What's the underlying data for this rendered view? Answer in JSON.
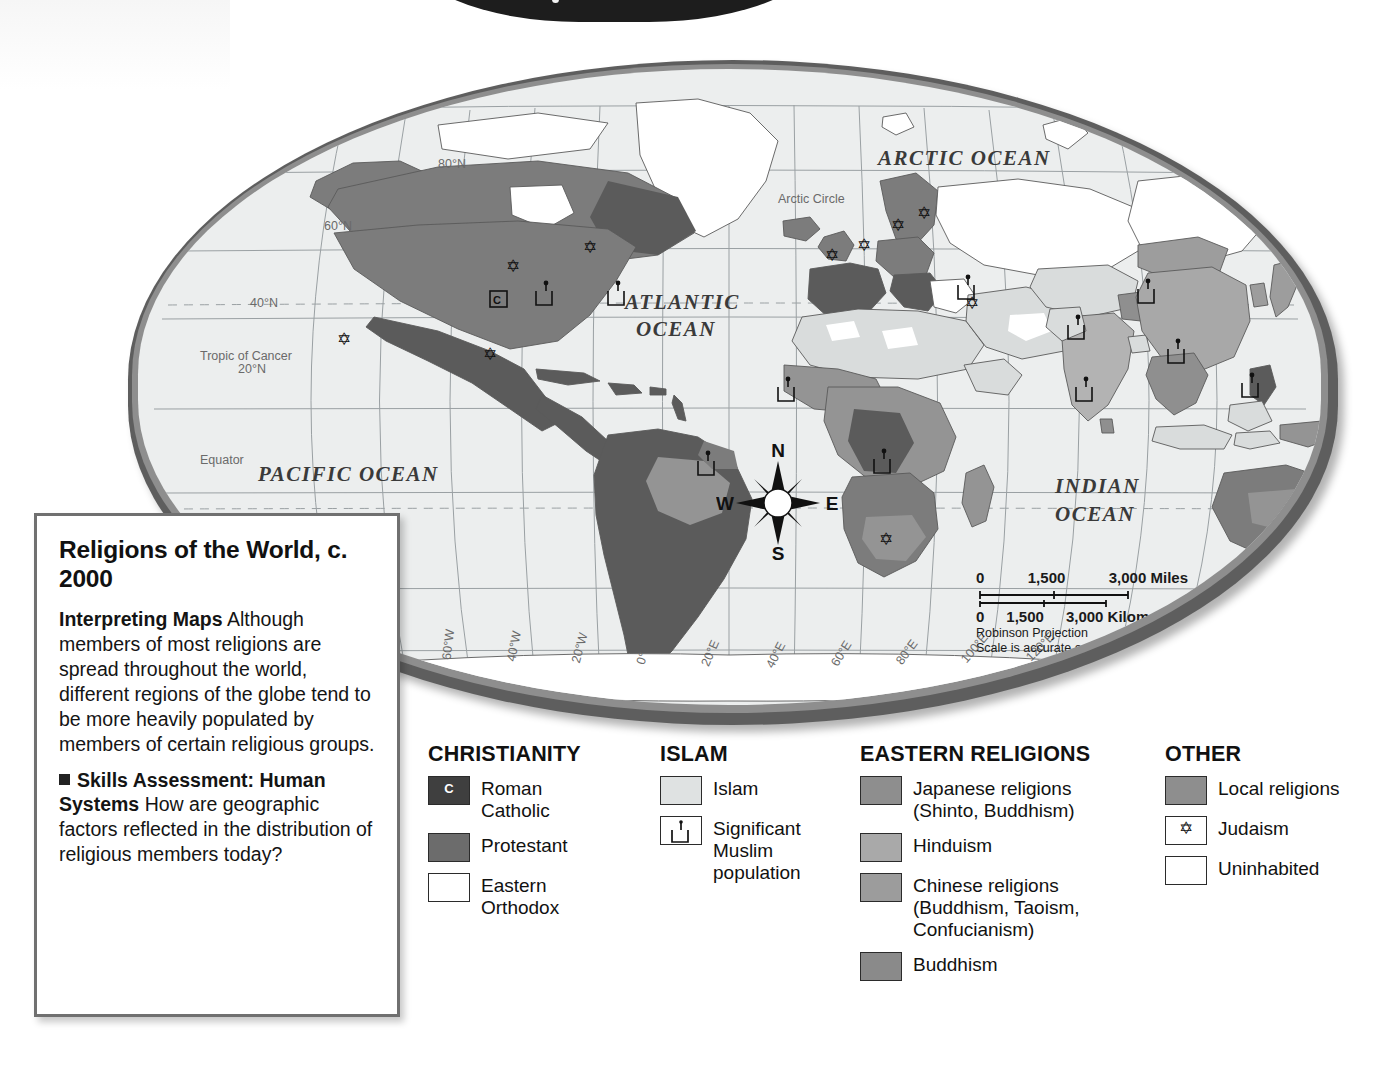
{
  "map": {
    "ocean_labels": [
      {
        "text": "ARCTIC OCEAN",
        "x": 740,
        "y": 96
      },
      {
        "text": "ATLANTIC",
        "x": 487,
        "y": 240
      },
      {
        "text": "OCEAN",
        "x": 498,
        "y": 267
      },
      {
        "text": "PACIFIC  OCEAN",
        "x": 120,
        "y": 412
      },
      {
        "text": "INDIAN",
        "x": 917,
        "y": 424
      },
      {
        "text": "OCEAN",
        "x": 917,
        "y": 452
      },
      {
        "text": "PACIFIC",
        "x": 1218,
        "y": 322
      },
      {
        "text": "OCEAN",
        "x": 1218,
        "y": 350
      }
    ],
    "arctic_circle_label": "Arctic Circle",
    "latitude_labels": [
      {
        "text": "80°N",
        "x": 300,
        "y": 99
      },
      {
        "text": "60°N",
        "x": 186,
        "y": 161
      },
      {
        "text": "40°N",
        "x": 112,
        "y": 238
      },
      {
        "text": "20°N",
        "x": 100,
        "y": 304
      },
      {
        "text": "Equator",
        "x": 62,
        "y": 395
      },
      {
        "text": "20°S",
        "x": 62,
        "y": 478
      }
    ],
    "tropic_labels": [
      {
        "text": "Tropic of Cancer",
        "x": 62,
        "y": 291
      },
      {
        "text": "Tropic of Capricorn",
        "x": 62,
        "y": 493
      }
    ],
    "longitude_labels": [
      "80°W",
      "60°W",
      "40°W",
      "20°W",
      "0°",
      "20°E",
      "40°E",
      "60°E",
      "80°E",
      "100°E",
      "120°E",
      "140°E",
      "160°E"
    ],
    "compass": {
      "north": "N",
      "south": "S",
      "east": "E",
      "west": "W"
    },
    "scale": {
      "miles_ticks": [
        "0",
        "1,500",
        "3,000 Miles"
      ],
      "km_ticks": [
        "0",
        "1,500",
        "3,000 Kilometers"
      ],
      "projection": "Robinson Projection",
      "note": "Scale is accurate only along the equator."
    }
  },
  "caption": {
    "title": "Religions of the World, c. 2000",
    "interpreting_lead": "Interpreting Maps",
    "interpreting_body": "Although members of most religions are spread throughout the world, different regions of the globe tend to be more heavily populated by members of certain religious groups.",
    "skills_lead": "Skills Assessment:",
    "skills_lead2": "Human Systems",
    "skills_body": "How are geographic factors reflected in the distribution of religious members today?"
  },
  "legend": {
    "columns": [
      {
        "title": "CHRISTIANITY",
        "items": [
          {
            "label": "Roman Catholic",
            "swatch": "cath",
            "glyph": "C",
            "color": "#3f3f3f"
          },
          {
            "label": "Protestant",
            "swatch": "prot",
            "glyph": "",
            "color": "#6c6c6c"
          },
          {
            "label": "Eastern Orthodox",
            "swatch": "orth",
            "glyph": "",
            "color": "#ffffff"
          }
        ]
      },
      {
        "title": "ISLAM",
        "items": [
          {
            "label": "Islam",
            "swatch": "islam",
            "glyph": "",
            "color": "#dfe2e2"
          },
          {
            "label": "Significant Muslim population",
            "swatch": "sigmus",
            "glyph": "mosque-icon",
            "color": "#ffffff"
          }
        ]
      },
      {
        "title": "EASTERN RELIGIONS",
        "items": [
          {
            "label": "Japanese religions (Shinto, Buddhism)",
            "swatch": "jap",
            "glyph": "",
            "color": "#8e8e8e"
          },
          {
            "label": "Hinduism",
            "swatch": "hindu",
            "glyph": "",
            "color": "#a9a9a9"
          },
          {
            "label": "Chinese religions (Buddhism, Taoism, Confucianism)",
            "swatch": "chin",
            "glyph": "",
            "color": "#9c9c9c"
          },
          {
            "label": "Buddhism",
            "swatch": "budd",
            "glyph": "",
            "color": "#8a8a8a"
          }
        ]
      },
      {
        "title": "OTHER",
        "items": [
          {
            "label": "Local religions",
            "swatch": "local",
            "glyph": "",
            "color": "#8e8e8e"
          },
          {
            "label": "Judaism",
            "swatch": "juda",
            "glyph": "star-of-david-icon",
            "color": "#ffffff"
          },
          {
            "label": "Uninhabited",
            "swatch": "uninh",
            "glyph": "",
            "color": "#ffffff"
          }
        ]
      }
    ]
  }
}
